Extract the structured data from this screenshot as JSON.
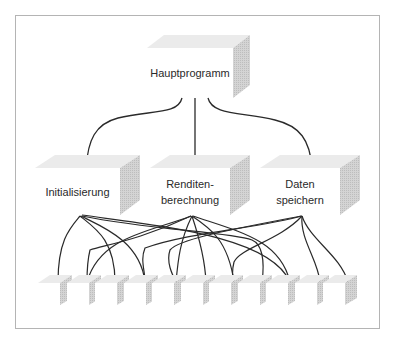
{
  "diagram": {
    "type": "hierarchy",
    "root": {
      "label": "Hauptprogramm"
    },
    "modules": [
      {
        "label": "Initialisierung"
      },
      {
        "label": "Renditen-\nberechnung"
      },
      {
        "label": "Daten\nspeichern"
      }
    ],
    "leaf_count": 11,
    "colors": {
      "line": "#2a2a2a",
      "box_front": "#ffffff",
      "box_top": "#e9e9e9",
      "box_side": "#cfcfcf",
      "frame": "#b4b4b4"
    }
  }
}
